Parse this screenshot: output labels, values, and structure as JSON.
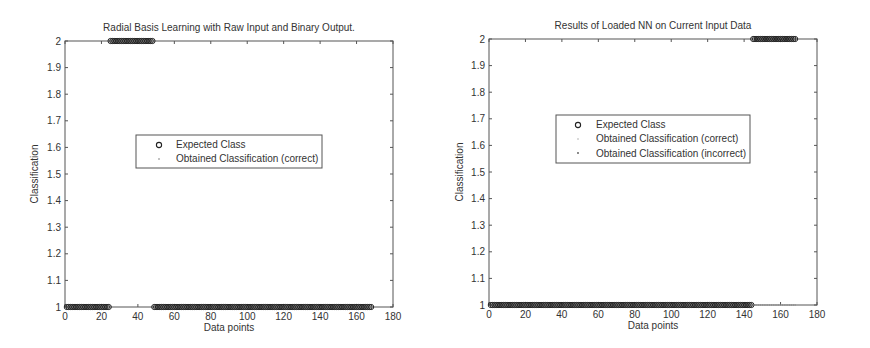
{
  "chart_data": [
    {
      "type": "scatter",
      "title": "Radial Basis Learning with  Raw Input and Binary Output.",
      "xlabel": "Data points",
      "ylabel": "Classification",
      "xlim": [
        0,
        180
      ],
      "ylim": [
        1,
        2
      ],
      "xticks": [
        0,
        20,
        40,
        60,
        80,
        100,
        120,
        140,
        160,
        180
      ],
      "yticks": [
        1,
        1.1,
        1.2,
        1.3,
        1.4,
        1.5,
        1.6,
        1.7,
        1.8,
        1.9,
        2
      ],
      "grid": false,
      "legend_position": "center",
      "legend": [
        "Expected Class",
        "Obtained Classification (correct)"
      ],
      "segments": [
        {
          "x_start": 1,
          "x_end": 24,
          "class": 1
        },
        {
          "x_start": 25,
          "x_end": 48,
          "class": 2
        },
        {
          "x_start": 49,
          "x_end": 168,
          "class": 1
        }
      ],
      "series": [
        {
          "name": "Expected Class",
          "marker": "circle",
          "description": "class 1 for x=1..24, class 2 for x=25..48, class 1 for x=49..168"
        },
        {
          "name": "Obtained Classification (correct)",
          "marker": "dot",
          "description": "matches expected for all 168 points"
        }
      ]
    },
    {
      "type": "scatter",
      "title": "Results of Loaded NN on Current Input Data",
      "xlabel": "Data points",
      "ylabel": "Classification",
      "xlim": [
        0,
        180
      ],
      "ylim": [
        1,
        2
      ],
      "xticks": [
        0,
        20,
        40,
        60,
        80,
        100,
        120,
        140,
        160,
        180
      ],
      "yticks": [
        1,
        1.1,
        1.2,
        1.3,
        1.4,
        1.5,
        1.6,
        1.7,
        1.8,
        1.9,
        2
      ],
      "grid": false,
      "legend_position": "center",
      "legend": [
        "Expected Class",
        "Obtained Classification (correct)",
        "Obtained Classification (incorrect)"
      ],
      "segments": [
        {
          "x_start": 1,
          "x_end": 144,
          "class": 1
        },
        {
          "x_start": 145,
          "x_end": 168,
          "class": 2
        }
      ],
      "series": [
        {
          "name": "Expected Class",
          "marker": "circle",
          "description": "class 1 for x=1..144, class 2 for x=145..168"
        },
        {
          "name": "Obtained Classification (correct)",
          "marker": "dot",
          "description": "class 1 for x=1..144"
        },
        {
          "name": "Obtained Classification (incorrect)",
          "marker": "dot",
          "description": "class 1 for x=145..168 (expected 2)"
        }
      ]
    }
  ],
  "charts": [
    {
      "title": "Radial Basis Learning with  Raw Input and Binary Output.",
      "xlabel": "Data points",
      "ylabel": "Classification",
      "legend": [
        "Expected Class",
        "Obtained Classification (correct)"
      ]
    },
    {
      "title": "Results of Loaded NN on Current Input Data",
      "xlabel": "Data points",
      "ylabel": "Classification",
      "legend": [
        "Expected Class",
        "Obtained Classification (correct)",
        "Obtained Classification (incorrect)"
      ]
    }
  ],
  "colors": {
    "axes": "#555555",
    "marker": "#222222",
    "text": "#333333"
  }
}
